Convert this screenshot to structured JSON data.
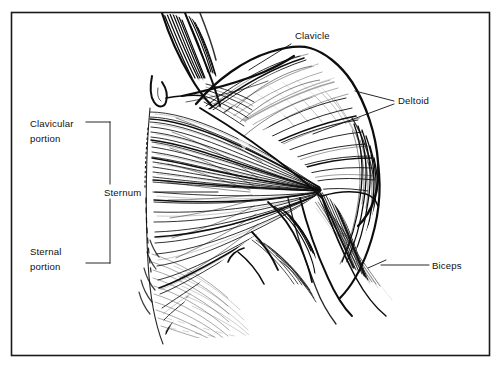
{
  "figure": {
    "kind": "anatomical-line-illustration",
    "style": "pen-and-ink hatching",
    "frame": {
      "stroke_color": "#1a1a1a",
      "fill_color": "#ffffff",
      "x": 11,
      "y": 12,
      "width": 479,
      "height": 344
    },
    "ink_color": "#0d0d0d",
    "background_color": "#ffffff"
  },
  "labels": {
    "clavicle": {
      "text": "Clavicle",
      "x": 295,
      "y": 39
    },
    "deltoid": {
      "text": "Deltoid",
      "x": 398,
      "y": 104
    },
    "biceps": {
      "text": "Biceps",
      "x": 432,
      "y": 267
    },
    "sternum": {
      "text": "Sternum",
      "x": 105,
      "y": 196
    },
    "clavicular_portion": {
      "line1": "Clavicular",
      "line2": "portion",
      "x": 30,
      "y1": 124,
      "y2": 139
    },
    "sternal_portion": {
      "line1": "Sternal",
      "line2": "portion",
      "x": 30,
      "y1": 252,
      "y2": 267
    }
  },
  "leaders": {
    "clavicle_leader": "line from label down-left to clavicle ridge",
    "deltoid_leader_upper": "line from label left to upper deltoid",
    "deltoid_leader_lower": "line from label down-left to mid deltoid",
    "biceps_leader": "horizontal line from label left to biceps belly",
    "sternum_leader": "horizontal line from label right to sternal fibers",
    "portion_bracket": "vertical bracket at x=110 spanning y=122 to y=263 with arms to each portion label"
  }
}
